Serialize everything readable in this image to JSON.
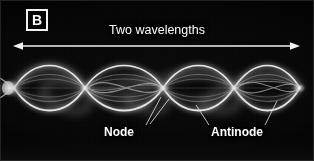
{
  "figure": {
    "panel_letter": "B",
    "background_color": "#000000",
    "foreground_color": "#ffffff",
    "width": 314,
    "height": 161
  },
  "annotations": {
    "span_caption": "Two wavelengths",
    "node_label": "Node",
    "antinode_label": "Antinode"
  },
  "span_arrow": {
    "x_start": 14,
    "x_end": 299,
    "y": 46,
    "double_headed": true,
    "color": "#f0f0f0"
  },
  "leader_lines": [
    {
      "name": "node-leader",
      "x1": 146,
      "y1": 124,
      "x2": 163,
      "y2": 96
    },
    {
      "name": "node-leader-right",
      "x1": 149,
      "y1": 124,
      "x2": 168,
      "y2": 98
    },
    {
      "name": "antinode-leader-left",
      "x1": 210,
      "y1": 124,
      "x2": 196,
      "y2": 104
    },
    {
      "name": "antinode-leader-right",
      "x1": 264,
      "y1": 124,
      "x2": 276,
      "y2": 100
    }
  ],
  "wave": {
    "description": "Time-exposure photograph of a vibrating string in its fourth harmonic",
    "harmonic": 4,
    "wavelength_count": 2,
    "loop_count": 4,
    "node_positions_px": [
      14,
      85,
      163,
      234,
      300
    ],
    "antinode_positions_px": [
      50,
      124,
      199,
      268
    ],
    "axis_y_px": 88,
    "amplitude_px": 28,
    "string_color": "#f5f5f5",
    "driver_position_px": 8
  }
}
